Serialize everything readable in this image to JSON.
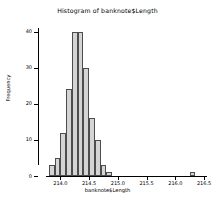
{
  "chart_data": {
    "type": "bar",
    "subtype": "histogram",
    "title": "Histogram of banknote$Length",
    "xlabel": "banknote$Length",
    "ylabel": "Frequency",
    "xlim": [
      213.75,
      216.55
    ],
    "ylim": [
      0,
      41
    ],
    "grid": false,
    "legend": null,
    "bin_width": 0.1,
    "bin_edges": [
      213.8,
      213.9,
      214.0,
      214.1,
      214.2,
      214.3,
      214.4,
      214.5,
      214.6,
      214.7,
      214.8,
      214.9,
      215.0,
      215.1,
      215.2,
      216.3,
      216.4
    ],
    "categories": [
      "213.8-213.9",
      "213.9-214.0",
      "214.0-214.1",
      "214.1-214.2",
      "214.2-214.3",
      "214.3-214.4",
      "214.4-214.5",
      "214.5-214.6",
      "214.6-214.7",
      "214.7-214.8",
      "214.8-214.9",
      "214.9-215.0",
      "215.0-215.1",
      "216.3-216.4"
    ],
    "values": [
      3,
      5,
      12,
      24,
      40,
      40,
      30,
      16,
      10,
      3,
      1,
      0,
      0,
      1
    ],
    "bars": [
      {
        "x0": 213.8,
        "x1": 213.9,
        "freq": 3
      },
      {
        "x0": 213.9,
        "x1": 214.0,
        "freq": 5
      },
      {
        "x0": 214.0,
        "x1": 214.1,
        "freq": 12
      },
      {
        "x0": 214.1,
        "x1": 214.2,
        "freq": 24
      },
      {
        "x0": 214.2,
        "x1": 214.3,
        "freq": 40
      },
      {
        "x0": 214.3,
        "x1": 214.4,
        "freq": 40
      },
      {
        "x0": 214.4,
        "x1": 214.5,
        "freq": 30
      },
      {
        "x0": 214.5,
        "x1": 214.6,
        "freq": 16
      },
      {
        "x0": 214.6,
        "x1": 214.7,
        "freq": 10
      },
      {
        "x0": 214.7,
        "x1": 214.8,
        "freq": 3
      },
      {
        "x0": 214.8,
        "x1": 214.9,
        "freq": 1
      },
      {
        "x0": 216.25,
        "x1": 216.35,
        "freq": 1
      }
    ],
    "xticks": [
      {
        "value": 214.0,
        "label": "214.0"
      },
      {
        "value": 214.5,
        "label": "214.5"
      },
      {
        "value": 215.0,
        "label": "215.0"
      },
      {
        "value": 215.5,
        "label": "215.5"
      },
      {
        "value": 216.0,
        "label": "216.0"
      },
      {
        "value": 216.5,
        "label": "216.5"
      }
    ],
    "yticks": [
      {
        "value": 0,
        "label": "0"
      },
      {
        "value": 10,
        "label": "10"
      },
      {
        "value": 20,
        "label": "20"
      },
      {
        "value": 30,
        "label": "30"
      },
      {
        "value": 40,
        "label": "40"
      }
    ],
    "colors": {
      "bar_fill": "#d4d4d4",
      "bar_border": "#4d4d4d",
      "axis": "#000000",
      "background": "#ffffff",
      "text": "#000000"
    }
  }
}
